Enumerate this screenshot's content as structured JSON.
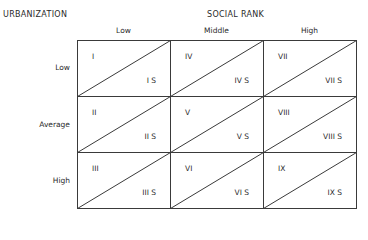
{
  "diagram": {
    "row_axis_title": "URBANIZATION",
    "col_axis_title": "SOCIAL RANK",
    "columns": [
      "Low",
      "Middle",
      "High"
    ],
    "rows": [
      "Low",
      "Average",
      "High"
    ],
    "cells": [
      [
        {
          "top": "I",
          "bottom": "I S"
        },
        {
          "top": "IV",
          "bottom": "IV S"
        },
        {
          "top": "VII",
          "bottom": "VII S"
        }
      ],
      [
        {
          "top": "II",
          "bottom": "II S"
        },
        {
          "top": "V",
          "bottom": "V S"
        },
        {
          "top": "VIII",
          "bottom": "VIII S"
        }
      ],
      [
        {
          "top": "III",
          "bottom": "III S"
        },
        {
          "top": "VI",
          "bottom": "VI S"
        },
        {
          "top": "IX",
          "bottom": "IX S"
        }
      ]
    ],
    "line_color": "#3a3a3a"
  }
}
